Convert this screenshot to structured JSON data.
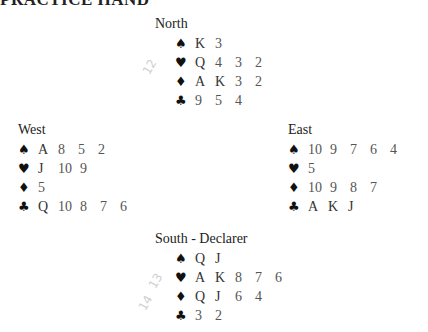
{
  "title": "PRACTICE HAND",
  "hands": {
    "north": {
      "label": "North",
      "spades": [
        "K",
        "3"
      ],
      "hearts": [
        "Q",
        "4",
        "3",
        "2"
      ],
      "diamonds": [
        "A",
        "K",
        "3",
        "2"
      ],
      "clubs": [
        "9",
        "5",
        "4"
      ]
    },
    "west": {
      "label": "West",
      "spades": [
        "A",
        "8",
        "5",
        "2"
      ],
      "hearts": [
        "J",
        "10",
        "9"
      ],
      "diamonds": [
        "5"
      ],
      "clubs": [
        "Q",
        "10",
        "8",
        "7",
        "6"
      ]
    },
    "east": {
      "label": "East",
      "spades": [
        "10",
        "9",
        "7",
        "6",
        "4"
      ],
      "hearts": [
        "5"
      ],
      "diamonds": [
        "10",
        "9",
        "8",
        "7"
      ],
      "clubs": [
        "A",
        "K",
        "J"
      ]
    },
    "south": {
      "label": "South - Declarer",
      "spades": [
        "Q",
        "J"
      ],
      "hearts": [
        "A",
        "K",
        "8",
        "7",
        "6"
      ],
      "diamonds": [
        "Q",
        "J",
        "6",
        "4"
      ],
      "clubs": [
        "3",
        "2"
      ]
    }
  },
  "suit_icons": {
    "spades": "♠",
    "hearts": "♥",
    "diamonds": "♦",
    "clubs": "♣"
  },
  "pencil_marks": [
    "12",
    "13",
    "14"
  ]
}
